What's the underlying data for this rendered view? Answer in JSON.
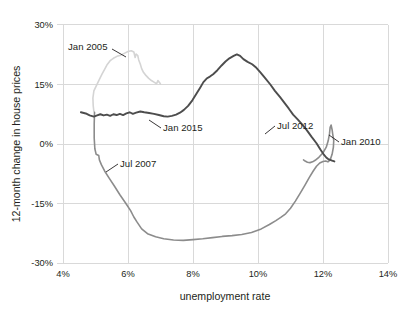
{
  "chart_data": {
    "type": "line",
    "title": "",
    "subtitle": "",
    "xlabel": "unemployment rate",
    "ylabel": "12-month change in house prices",
    "xlim": [
      3.2,
      14.6
    ],
    "ylim": [
      -33,
      32
    ],
    "xticks": [
      "4%",
      "6%",
      "8%",
      "10%",
      "12%",
      "14%"
    ],
    "xtick_values": [
      4,
      6,
      8,
      10,
      12,
      14
    ],
    "yticks": [
      "30%",
      "15%",
      "0%",
      "-15%",
      "-30%"
    ],
    "ytick_values": [
      30,
      15,
      0,
      -15,
      -30
    ],
    "grid": true,
    "legend": "none",
    "note": "Connected scatter (phase plot) of unemployment rate vs 12-month change in house prices over time; a single trajectory drawn in three shades of grey from light (earliest) to dark (latest).",
    "series": [
      {
        "name": "2004-2007 (light grey)",
        "color": "#d4d4d4",
        "points": [
          [
            4.95,
            8.2
          ],
          [
            4.93,
            9.6
          ],
          [
            4.92,
            11.6
          ],
          [
            4.95,
            13.4
          ],
          [
            5.02,
            14.6
          ],
          [
            5.12,
            16.3
          ],
          [
            5.2,
            17.6
          ],
          [
            5.28,
            18.8
          ],
          [
            5.35,
            19.9
          ],
          [
            5.45,
            21.0
          ],
          [
            5.55,
            21.6
          ],
          [
            5.66,
            22.1
          ],
          [
            5.78,
            22.4
          ],
          [
            5.9,
            22.9
          ],
          [
            6.0,
            23.3
          ],
          [
            6.1,
            23.5
          ],
          [
            6.18,
            23.2
          ],
          [
            6.22,
            21.8
          ],
          [
            6.25,
            22.7
          ],
          [
            6.3,
            22.3
          ],
          [
            6.33,
            21.2
          ],
          [
            6.38,
            20.1
          ],
          [
            6.42,
            19.0
          ],
          [
            6.48,
            18.0
          ],
          [
            6.55,
            17.3
          ],
          [
            6.63,
            16.6
          ],
          [
            6.72,
            16.0
          ],
          [
            6.8,
            15.6
          ],
          [
            6.88,
            15.2
          ],
          [
            6.92,
            16.0
          ],
          [
            6.98,
            15.4
          ],
          [
            7.0,
            15.1
          ]
        ]
      },
      {
        "name": "2007-2013 (medium grey)",
        "color": "#8c8c8c",
        "points": [
          [
            4.97,
            8.0
          ],
          [
            4.96,
            5.0
          ],
          [
            4.96,
            1.5
          ],
          [
            4.98,
            -1.2
          ],
          [
            5.02,
            -2.6
          ],
          [
            5.1,
            -2.9
          ],
          [
            5.12,
            -4.0
          ],
          [
            5.18,
            -5.2
          ],
          [
            5.28,
            -6.8
          ],
          [
            5.42,
            -8.6
          ],
          [
            5.58,
            -10.6
          ],
          [
            5.75,
            -12.8
          ],
          [
            5.92,
            -14.8
          ],
          [
            6.08,
            -16.8
          ],
          [
            6.18,
            -18.4
          ],
          [
            6.28,
            -19.7
          ],
          [
            6.42,
            -21.4
          ],
          [
            6.6,
            -22.6
          ],
          [
            6.85,
            -23.4
          ],
          [
            7.1,
            -23.9
          ],
          [
            7.4,
            -24.2
          ],
          [
            7.7,
            -24.3
          ],
          [
            8.0,
            -24.1
          ],
          [
            8.3,
            -23.9
          ],
          [
            8.6,
            -23.6
          ],
          [
            8.9,
            -23.3
          ],
          [
            9.2,
            -23.1
          ],
          [
            9.5,
            -22.8
          ],
          [
            9.8,
            -22.3
          ],
          [
            10.1,
            -21.4
          ],
          [
            10.35,
            -20.3
          ],
          [
            10.55,
            -19.3
          ],
          [
            10.7,
            -18.5
          ],
          [
            10.85,
            -17.6
          ],
          [
            11.0,
            -16.2
          ],
          [
            11.15,
            -14.4
          ],
          [
            11.3,
            -12.4
          ],
          [
            11.45,
            -10.3
          ],
          [
            11.58,
            -8.4
          ],
          [
            11.7,
            -6.8
          ],
          [
            11.8,
            -5.6
          ],
          [
            11.9,
            -4.8
          ],
          [
            12.0,
            -4.4
          ],
          [
            12.08,
            -4.3
          ],
          [
            12.15,
            -4.5
          ],
          [
            12.22,
            -4.0
          ],
          [
            12.28,
            -2.6
          ],
          [
            12.32,
            -0.8
          ],
          [
            12.33,
            0.9
          ],
          [
            12.3,
            2.4
          ],
          [
            12.28,
            3.6
          ],
          [
            12.26,
            4.4
          ],
          [
            12.25,
            4.8
          ],
          [
            12.22,
            4.2
          ],
          [
            12.2,
            2.6
          ],
          [
            12.16,
            0.8
          ],
          [
            12.1,
            -0.8
          ],
          [
            12.0,
            -2.2
          ],
          [
            11.88,
            -3.3
          ],
          [
            11.76,
            -4.1
          ],
          [
            11.68,
            -4.5
          ],
          [
            11.6,
            -4.7
          ],
          [
            11.52,
            -4.6
          ],
          [
            11.45,
            -4.3
          ],
          [
            11.4,
            -4.0
          ]
        ]
      },
      {
        "name": "2012-2016 (dark grey)",
        "color": "#4d4d4d",
        "points": [
          [
            4.55,
            8.0
          ],
          [
            4.7,
            7.7
          ],
          [
            4.82,
            7.2
          ],
          [
            4.95,
            6.9
          ],
          [
            5.05,
            7.2
          ],
          [
            5.15,
            7.5
          ],
          [
            5.25,
            7.2
          ],
          [
            5.35,
            7.4
          ],
          [
            5.45,
            7.1
          ],
          [
            5.55,
            7.5
          ],
          [
            5.65,
            7.3
          ],
          [
            5.75,
            7.6
          ],
          [
            5.85,
            7.3
          ],
          [
            5.95,
            7.7
          ],
          [
            6.05,
            8.0
          ],
          [
            6.15,
            7.6
          ],
          [
            6.25,
            7.9
          ],
          [
            6.38,
            8.2
          ],
          [
            6.5,
            8.0
          ],
          [
            6.65,
            7.8
          ],
          [
            6.8,
            7.6
          ],
          [
            6.95,
            7.3
          ],
          [
            7.1,
            7.0
          ],
          [
            7.22,
            6.9
          ],
          [
            7.35,
            7.1
          ],
          [
            7.48,
            7.4
          ],
          [
            7.6,
            7.9
          ],
          [
            7.72,
            8.6
          ],
          [
            7.85,
            9.6
          ],
          [
            7.98,
            11.0
          ],
          [
            8.1,
            12.6
          ],
          [
            8.22,
            14.2
          ],
          [
            8.32,
            15.6
          ],
          [
            8.42,
            16.5
          ],
          [
            8.52,
            17.0
          ],
          [
            8.62,
            17.6
          ],
          [
            8.75,
            18.6
          ],
          [
            8.88,
            19.8
          ],
          [
            9.0,
            20.8
          ],
          [
            9.12,
            21.6
          ],
          [
            9.25,
            22.2
          ],
          [
            9.35,
            22.6
          ],
          [
            9.45,
            22.2
          ],
          [
            9.55,
            21.4
          ],
          [
            9.68,
            20.7
          ],
          [
            9.82,
            20.1
          ],
          [
            9.95,
            19.2
          ],
          [
            10.08,
            18.0
          ],
          [
            10.22,
            16.6
          ],
          [
            10.38,
            15.0
          ],
          [
            10.52,
            13.4
          ],
          [
            10.68,
            11.8
          ],
          [
            10.82,
            10.3
          ],
          [
            10.95,
            8.9
          ],
          [
            11.08,
            7.4
          ],
          [
            11.22,
            6.2
          ],
          [
            11.35,
            5.0
          ],
          [
            11.5,
            3.5
          ],
          [
            11.65,
            1.8
          ],
          [
            11.8,
            0.2
          ],
          [
            11.92,
            -1.4
          ],
          [
            12.02,
            -2.6
          ],
          [
            12.1,
            -3.4
          ],
          [
            12.16,
            -3.8
          ],
          [
            12.22,
            -4.0
          ],
          [
            12.28,
            -4.2
          ],
          [
            12.35,
            -4.4
          ]
        ]
      }
    ],
    "annotations": [
      {
        "label": "Jan 2005",
        "text_x": 68,
        "text_y": 50,
        "anchor": "start",
        "leader": [
          [
            112,
            49
          ],
          [
            126,
            57
          ]
        ]
      },
      {
        "label": "Jul 2007",
        "text_x": 120,
        "text_y": 167,
        "anchor": "start",
        "leader": [
          [
            118,
            164
          ],
          [
            106,
            172
          ]
        ]
      },
      {
        "label": "Jan 2015",
        "text_x": 163,
        "text_y": 131,
        "anchor": "start",
        "leader": [
          [
            161,
            128
          ],
          [
            149,
            120
          ]
        ]
      },
      {
        "label": "Jul 2012",
        "text_x": 277,
        "text_y": 129,
        "anchor": "start",
        "leader": [
          [
            275,
            126
          ],
          [
            265,
            134
          ]
        ]
      },
      {
        "label": "Jan 2010",
        "text_x": 341,
        "text_y": 145,
        "anchor": "start",
        "leader": [
          [
            339,
            142
          ],
          [
            329,
            135
          ]
        ]
      }
    ]
  },
  "axes": {
    "plot_left": 63,
    "plot_right": 388,
    "plot_top": 25,
    "plot_bottom": 263,
    "x_per_pct": 32.5,
    "y_per_pct": 3.9667
  }
}
